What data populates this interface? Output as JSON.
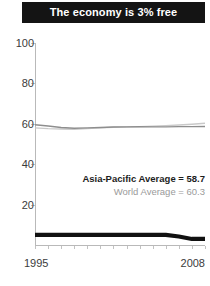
{
  "title": "The economy is 3% free",
  "annotations": {
    "asia_pacific": "Asia-Pacific Average = 58.7",
    "world": "World Average = 60.3"
  },
  "axis": {
    "x_start_label": "1995",
    "x_end_label": "2008",
    "y_labels": [
      "100",
      "80",
      "60",
      "40",
      "20"
    ]
  },
  "chart_data": {
    "type": "line",
    "title": "The economy is 3% free",
    "xlabel": "",
    "ylabel": "",
    "xlim": [
      1995,
      2008
    ],
    "ylim": [
      0,
      100
    ],
    "yticks": [
      20,
      40,
      60,
      80,
      100
    ],
    "xticks": [
      1995,
      1996,
      1997,
      1998,
      1999,
      2000,
      2001,
      2002,
      2003,
      2004,
      2005,
      2006,
      2007,
      2008
    ],
    "grid": false,
    "legend": "none",
    "x": [
      1995,
      1996,
      1997,
      1998,
      1999,
      2000,
      2001,
      2002,
      2003,
      2004,
      2005,
      2006,
      2007,
      2008
    ],
    "series": [
      {
        "name": "World Average",
        "color": "#c9c9c9",
        "width": 1.4,
        "values": [
          58.0,
          57.6,
          57.4,
          57.3,
          57.6,
          58.0,
          58.3,
          58.4,
          58.6,
          58.8,
          59.1,
          59.4,
          59.8,
          60.3
        ]
      },
      {
        "name": "Asia-Pacific Average",
        "color": "#8e8e8e",
        "width": 1.4,
        "values": [
          59.5,
          58.9,
          58.2,
          57.8,
          58.0,
          58.2,
          58.4,
          58.5,
          58.6,
          58.5,
          58.5,
          58.6,
          58.6,
          58.7
        ]
      },
      {
        "name": "Economic Freedom (country)",
        "color": "#111111",
        "width": 4.2,
        "values": [
          5.0,
          5.0,
          5.0,
          5.0,
          5.0,
          5.0,
          5.0,
          5.0,
          5.0,
          5.0,
          5.0,
          4.2,
          3.0,
          3.0
        ]
      }
    ],
    "annotations": [
      {
        "text": "Asia-Pacific Average = 58.7",
        "value": 58.7
      },
      {
        "text": "World Average = 60.3",
        "value": 60.3
      }
    ]
  }
}
